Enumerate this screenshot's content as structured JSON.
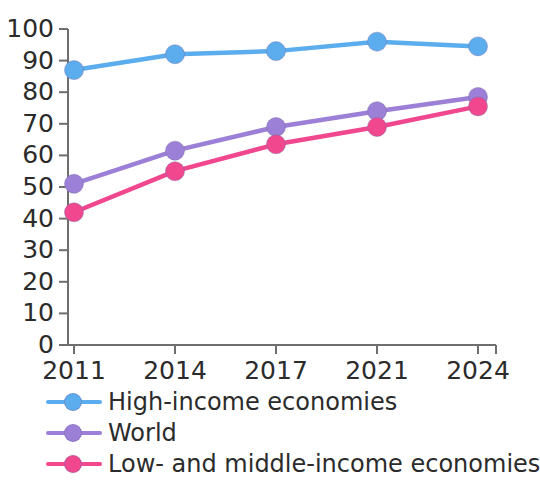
{
  "chart_data": {
    "type": "line",
    "title": "",
    "subtitle": "",
    "xlabel": "",
    "ylabel": "",
    "categories": [
      "2011",
      "2014",
      "2017",
      "2021",
      "2024"
    ],
    "ylim": [
      0,
      100
    ],
    "yticks": [
      0,
      10,
      20,
      30,
      40,
      50,
      60,
      70,
      80,
      90,
      100
    ],
    "ytick_labels": [
      "0",
      "10",
      "20",
      "30",
      "40",
      "50",
      "60",
      "70",
      "80",
      "90",
      "100"
    ],
    "grid": false,
    "legend_position": "bottom-left",
    "series": [
      {
        "name": "High-income economies",
        "color": "#5BADEE",
        "marker": "circle",
        "values": [
          87,
          92,
          93,
          96,
          94.5
        ]
      },
      {
        "name": "World",
        "color": "#9C7FD6",
        "marker": "circle",
        "values": [
          51,
          61.5,
          69,
          74,
          78.5
        ]
      },
      {
        "name": "Low- and middle-income economies",
        "color": "#F0478F",
        "marker": "circle",
        "values": [
          42,
          55,
          63.5,
          69,
          75.5
        ]
      }
    ]
  },
  "axis": {
    "line_color": "#6e6e6e",
    "tick_color": "#6e6e6e",
    "label_color": "#2b2b2b"
  },
  "legend": {
    "items": [
      {
        "label": "High-income economies",
        "color": "#5BADEE"
      },
      {
        "label": "World",
        "color": "#9C7FD6"
      },
      {
        "label": "Low- and middle-income economies",
        "color": "#F0478F"
      }
    ]
  }
}
